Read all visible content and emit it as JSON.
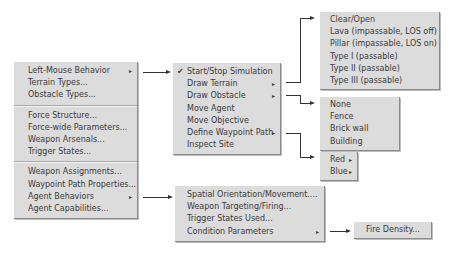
{
  "main_menu": {
    "groups": [
      [
        {
          "label": "Left-Mouse Behavior",
          "submenu": true
        },
        {
          "label": "Terrain Types..."
        },
        {
          "label": "Obstacle Types..."
        }
      ],
      [
        {
          "label": "Force Structure..."
        },
        {
          "label": "Force-wide Parameters..."
        },
        {
          "label": "Weapon Arsenals..."
        },
        {
          "label": "Trigger States..."
        }
      ],
      [
        {
          "label": "Weapon Assignments..."
        },
        {
          "label": "Waypoint Path Properties..."
        },
        {
          "label": "Agent Behaviors",
          "submenu": true
        },
        {
          "label": "Agent Capabilities..."
        }
      ]
    ]
  },
  "left_mouse_menu": {
    "items": [
      {
        "label": "Start/Stop Simulation",
        "checked": true
      },
      {
        "label": "Draw Terrain",
        "submenu": true
      },
      {
        "label": "Draw Obstacle",
        "submenu": true
      },
      {
        "label": "Move Agent"
      },
      {
        "label": "Move Objective"
      },
      {
        "label": "Define Waypoint Path",
        "submenu": true
      },
      {
        "label": "Inspect Site"
      }
    ],
    "check_glyph": "✔",
    "submenu_glyph": "▸"
  },
  "terrain_menu": {
    "items": [
      "Clear/Open",
      "Lava (impassable, LOS off)",
      "Pillar (impassable, LOS on)",
      "Type I (passable)",
      "Type II (passable)",
      "Type III (passable)"
    ]
  },
  "obstacle_menu": {
    "items": [
      "None",
      "Fence",
      "Brick wall",
      "Building"
    ]
  },
  "team_menu": {
    "items": [
      {
        "label": "Red",
        "submenu": true
      },
      {
        "label": "Blue",
        "submenu": true
      }
    ]
  },
  "behaviors_menu": {
    "items": [
      {
        "label": "Spatial Orientation/Movement...."
      },
      {
        "label": "Weapon Targeting/Firing..."
      },
      {
        "label": "Trigger States Used..."
      },
      {
        "label": "Condition Parameters",
        "submenu": true
      }
    ]
  },
  "condition_menu": {
    "items": [
      "Fire Density..."
    ]
  }
}
